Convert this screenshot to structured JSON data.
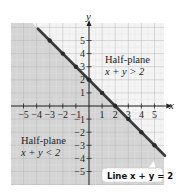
{
  "chart_data": {
    "type": "line",
    "title": "",
    "xlabel": "x",
    "ylabel": "y",
    "xlim": [
      -6,
      5.7
    ],
    "ylim": [
      -6.1,
      6.4
    ],
    "grid": true,
    "x_ticks": [
      -5,
      -4,
      -3,
      -2,
      -1,
      1,
      2,
      3,
      4,
      5
    ],
    "y_ticks": [
      5,
      4,
      3,
      2,
      1,
      -1,
      -2,
      -3,
      -4,
      -5
    ],
    "x_tick_labels": [
      "−5",
      "−4",
      "−3",
      "−2",
      "−1",
      "1",
      "2",
      "3",
      "4",
      "5"
    ],
    "y_tick_labels": [
      "5",
      "4",
      "3",
      "2",
      "1",
      "−1",
      "−2",
      "−3",
      "−4",
      "−5"
    ],
    "series": [
      {
        "name": "Line x + y = 2",
        "equation": "x + y = 2",
        "points": [
          [
            -3,
            5
          ],
          [
            -2,
            4
          ],
          [
            -1,
            3
          ],
          [
            0,
            2
          ],
          [
            1,
            1
          ],
          [
            2,
            0
          ],
          [
            3,
            -1
          ],
          [
            4,
            -2
          ],
          [
            5,
            -3
          ]
        ]
      }
    ],
    "regions": [
      {
        "name": "Half-plane x + y > 2",
        "shaded": false
      },
      {
        "name": "Half-plane x + y < 2",
        "shaded": true
      }
    ],
    "annotations": [
      {
        "text": "Half-plane",
        "subtext": "x + y > 2",
        "at": [
          1.2,
          3.2
        ]
      },
      {
        "text": "Half-plane",
        "subtext": "x + y < 2",
        "at": [
          -5.8,
          -2.3
        ]
      },
      {
        "text": "Line x + y = 2",
        "callout_to": [
          5,
          -3
        ]
      }
    ]
  },
  "labels": {
    "x_axis": "x",
    "y_axis": "y",
    "upper_title": "Half-plane",
    "upper_ineq": "x + y > 2",
    "lower_title": "Half-plane",
    "lower_ineq": "x + y < 2",
    "callout": "Line x + y = 2"
  },
  "colors": {
    "shade": "#d4d4d4",
    "grid_shaded": "#b8b8b8",
    "grid_unshaded": "#e2e2e2",
    "line": "#3a3a3a",
    "axis": "#222222",
    "callout_bg": "#ffffff"
  }
}
